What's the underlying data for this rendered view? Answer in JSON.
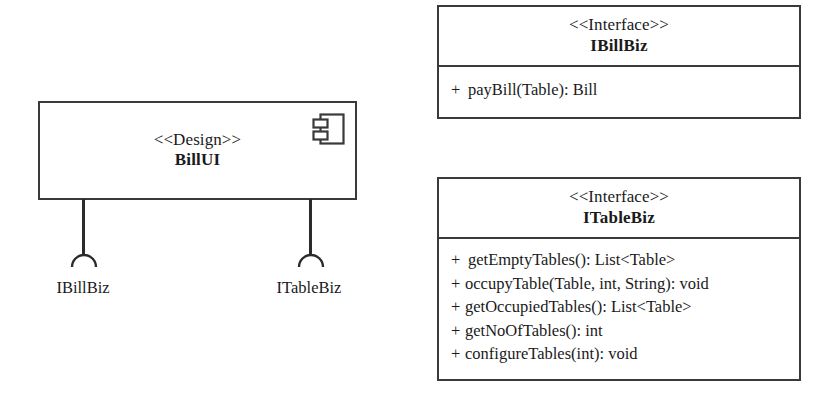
{
  "diagram": {
    "type": "uml-component-diagram",
    "component": {
      "stereotype": "<<Design>>",
      "name": "BillUI",
      "icon": "uml-component-icon"
    },
    "provided_interfaces": [
      {
        "id": "ibillbiz",
        "label": "IBillBiz",
        "connector_icon": "required-interface-socket-icon"
      },
      {
        "id": "itablebiz",
        "label": "ITableBiz",
        "connector_icon": "required-interface-socket-icon"
      }
    ],
    "interfaces": [
      {
        "id": "ibillbiz",
        "stereotype": "<<Interface>>",
        "name": "IBillBiz",
        "members": [
          {
            "visibility": "+",
            "signature": "payBill(Table): Bill"
          }
        ]
      },
      {
        "id": "itablebiz",
        "stereotype": "<<Interface>>",
        "name": "ITableBiz",
        "members": [
          {
            "visibility": "+",
            "signature": "getEmptyTables(): List<Table>"
          },
          {
            "visibility": "+",
            "signature": "occupyTable(Table, int, String): void"
          },
          {
            "visibility": "+",
            "signature": "getOccupiedTables(): List<Table>"
          },
          {
            "visibility": "+",
            "signature": "getNoOfTables(): int"
          },
          {
            "visibility": "+",
            "signature": "configureTables(int): void"
          }
        ]
      }
    ],
    "colors": {
      "stroke": "#3a3a3a",
      "connector": "#2b2b2b",
      "text": "#1a1a1a",
      "background": "#ffffff"
    }
  }
}
